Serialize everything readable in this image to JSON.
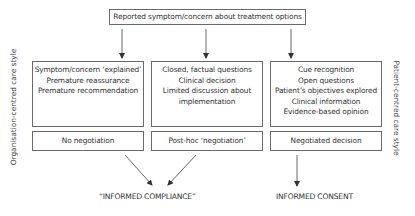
{
  "top": {
    "label": "Reported symptom/concern about treatment options"
  },
  "side_labels": {
    "left": "Organisation-centred care style",
    "right": "Patient-centred care style"
  },
  "columns": [
    {
      "lines": [
        "Symptom/concern ‘explained’",
        "Premature reassurance",
        "Premature recommendation"
      ],
      "decision": "No negotiation"
    },
    {
      "lines": [
        "Closed, factual questions",
        "Clinical decision",
        "Limited discussion about",
        "implementation"
      ],
      "decision": "Post-hoc ‘negotiation’"
    },
    {
      "lines": [
        "Cue recognition",
        "Open questions",
        "Patient’s objectives explored",
        "Clinical information",
        "Evidence-based opinion"
      ],
      "decision": "Negotiated decision"
    }
  ],
  "outcomes": {
    "compliance": "“INFORMED COMPLIANCE”",
    "consent": "INFORMED CONSENT"
  },
  "colors": {
    "line": "#555555",
    "text": "#333333"
  }
}
